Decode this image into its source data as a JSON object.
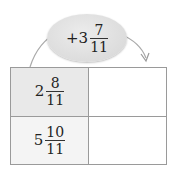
{
  "operator": {
    "sign": "+",
    "whole": "3",
    "numerator": "7",
    "denominator": "11"
  },
  "table": {
    "rows": [
      {
        "input": {
          "whole": "2",
          "numerator": "8",
          "denominator": "11"
        },
        "output": ""
      },
      {
        "input": {
          "whole": "5",
          "numerator": "10",
          "denominator": "11"
        },
        "output": ""
      }
    ]
  },
  "colors": {
    "bubble": "#dcdcdc",
    "cell_shade_row1": "#e9e9e9",
    "cell_shade_row2": "#f4f4f4",
    "border": "#9a9a9a",
    "arrow": "#aaaaaa"
  }
}
